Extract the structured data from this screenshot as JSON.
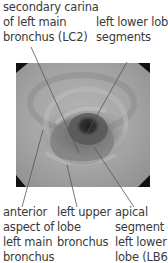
{
  "figure": {
    "image_alt": "bronchoscopic view of left main bronchus",
    "labels": {
      "top_left": "secondary carina\nof left main\nbronchus (LC2)",
      "top_right": "left lower lobe\nsegments",
      "bottom_left": "anterior\naspect of\nleft main\nbronchus",
      "bottom_middle": "left upper\nlobe\nbronchus",
      "bottom_right": "apical\nsegment of\nleft lower\nlobe (LB6)"
    }
  }
}
